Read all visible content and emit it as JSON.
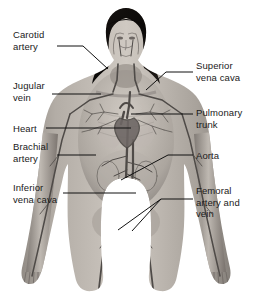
{
  "figure": {
    "style": "grayscale-medical-illustration",
    "background_color": "#ffffff",
    "text_color": "#1a1a1a",
    "leader_line_color": "#111111",
    "skin_tone": "#a9a39c",
    "hair_color": "#100d0c",
    "vessel_color": "#5e5a57"
  },
  "labels_left": [
    {
      "id": "carotid-artery",
      "text": "Carotid\nartery",
      "x": 13,
      "y": 29
    },
    {
      "id": "jugular-vein",
      "text": "Jugular\nvein",
      "x": 13,
      "y": 80
    },
    {
      "id": "heart",
      "text": "Heart",
      "x": 13,
      "y": 123
    },
    {
      "id": "brachial-artery",
      "text": "Brachial\nartery",
      "x": 13,
      "y": 141
    },
    {
      "id": "inferior-vena-cava",
      "text": "Inferior\nvena cava",
      "x": 13,
      "y": 182
    }
  ],
  "labels_right": [
    {
      "id": "superior-vena-cava",
      "text": "Superior\nvena cava",
      "x": 196,
      "y": 60
    },
    {
      "id": "pulmonary-trunk",
      "text": "Pulmonary\ntrunk",
      "x": 196,
      "y": 107
    },
    {
      "id": "aorta",
      "text": "Aorta",
      "x": 196,
      "y": 150
    },
    {
      "id": "femoral-artery-and-vein",
      "text": "Femoral\nartery and\nvein",
      "x": 196,
      "y": 185
    }
  ],
  "leader_lines": [
    {
      "id": "leader-carotid-artery",
      "points": "57,46 83,46 108,69"
    },
    {
      "id": "leader-jugular-vein",
      "points": "52,94 101,94"
    },
    {
      "id": "leader-heart",
      "points": "46,128 131,128"
    },
    {
      "id": "leader-brachial-artery",
      "points": "57,155 96,155"
    },
    {
      "id": "leader-inferior-vena-cava",
      "points": "63,193 136,193"
    },
    {
      "id": "leader-superior-vena-cava",
      "points": "193,72 166,72 146,90"
    },
    {
      "id": "leader-pulmonary-trunk",
      "points": "193,114 131,114"
    },
    {
      "id": "leader-aorta",
      "points": "193,155 168,155 121,180"
    },
    {
      "id": "leader-femoral-a",
      "points": "193,199 161,199 118,230"
    },
    {
      "id": "leader-femoral-b",
      "points": "161,199 132,231"
    }
  ]
}
